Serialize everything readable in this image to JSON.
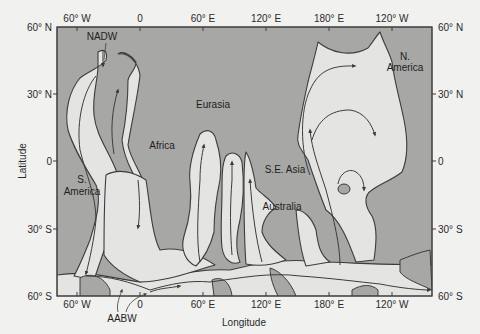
{
  "figure": {
    "colors": {
      "background": "#f1f1ef",
      "land": "#a7a7a5",
      "deep_water": "#e4e4e2",
      "outline": "#3c3c3c"
    }
  },
  "axes": {
    "xlabel": "Longitude",
    "ylabel": "Latitude",
    "top_ticks": [
      "60° W",
      "0",
      "60° E",
      "120° E",
      "180° E",
      "120° W"
    ],
    "bottom_ticks": [
      "60° W",
      "0",
      "60° E",
      "120° E",
      "180° E",
      "120° W"
    ],
    "left_ticks": [
      "60° N",
      "30° N",
      "0",
      "30° S",
      "60° S"
    ],
    "right_ticks": [
      "60° N",
      "30° N",
      "0",
      "30° S",
      "60° S"
    ]
  },
  "labels": {
    "nadw": "NADW",
    "aabw": "AABW",
    "eurasia": "Eurasia",
    "africa": "Africa",
    "s_america_1": "S.",
    "s_america_2": "America",
    "n_america_1": "N.",
    "n_america_2": "America",
    "se_asia": "S.E. Asia",
    "australia": "Australia"
  }
}
